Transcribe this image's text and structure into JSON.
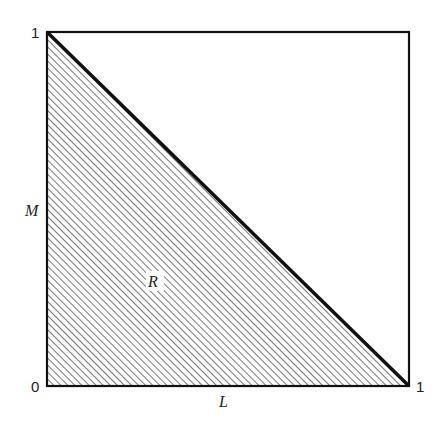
{
  "diagram": {
    "type": "unit-square region diagram",
    "x_axis": {
      "label": "L",
      "ticks": [
        "0",
        "1"
      ]
    },
    "y_axis": {
      "label": "M",
      "ticks": [
        "0",
        "1"
      ]
    },
    "region": {
      "label": "R",
      "description": "lower-left triangle below line from (0,1) to (1,0), hatched"
    },
    "colors": {
      "line": "#111111",
      "hatch": "#555555",
      "background": "#ffffff"
    }
  }
}
